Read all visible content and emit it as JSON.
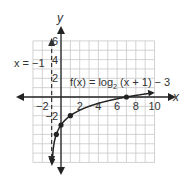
{
  "chart_data": {
    "type": "line",
    "title": "",
    "function_label": "f(x) = log2 (x + 1) − 3",
    "function_label_parts": {
      "prefix": "f(x) = log",
      "sub": "2",
      "suffix": " (x + 1) − 3"
    },
    "asymptote_label": "x = −1",
    "asymptote_x": -1,
    "xlabel": "x",
    "ylabel": "y",
    "xlim": [
      -3,
      10
    ],
    "ylim": [
      -7,
      6
    ],
    "x_ticks": [
      -2,
      2,
      4,
      6,
      8,
      10
    ],
    "y_ticks": [
      6,
      4,
      2,
      -2
    ],
    "grid": true,
    "key_points": [
      {
        "x": -0.5,
        "y": -4
      },
      {
        "x": 0,
        "y": -3
      },
      {
        "x": 1,
        "y": -2
      },
      {
        "x": 7,
        "y": 0
      }
    ],
    "series": [
      {
        "name": "f(x) = log2(x+1) - 3",
        "x": [
          -0.9,
          -0.75,
          -0.5,
          0,
          1,
          3,
          7,
          9.5
        ],
        "y": [
          -6.32,
          -5,
          -4,
          -3,
          -2,
          -1,
          0,
          0.39
        ]
      }
    ]
  }
}
